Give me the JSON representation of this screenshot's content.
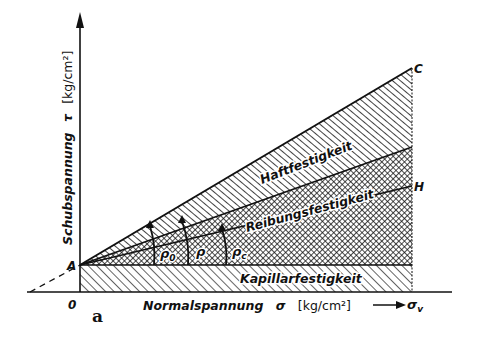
{
  "figure": {
    "panel_label": "a",
    "y_axis": {
      "label": "Schubspannung",
      "symbol": "τ",
      "unit": "[kg/cm²]"
    },
    "x_axis": {
      "label": "Normalspannung",
      "symbol": "σ",
      "unit": "[kg/cm²]",
      "end_label": "σv",
      "arrow": "⟶"
    },
    "points": {
      "origin": "0",
      "A": "A",
      "C": "C",
      "H": "H"
    },
    "regions": [
      {
        "name": "Haftfestigkeit",
        "label": "Haftfestigkeit",
        "pattern": "diagonal-hatch"
      },
      {
        "name": "Reibungsfestigkeit",
        "label": "Reibungsfestigkeit",
        "pattern": "cross-hatch"
      },
      {
        "name": "Kapillarfestigkeit",
        "label": "Kapillarfestigkeit",
        "pattern": "diagonal-hatch"
      }
    ],
    "angles": [
      {
        "label": "ρ0",
        "base": "ρ",
        "sub": "0"
      },
      {
        "label": "ρ",
        "base": "ρ",
        "sub": ""
      },
      {
        "label": "ρc",
        "base": "ρ",
        "sub": "c"
      }
    ],
    "colors": {
      "ink": "#111111",
      "background": "#ffffff"
    }
  }
}
